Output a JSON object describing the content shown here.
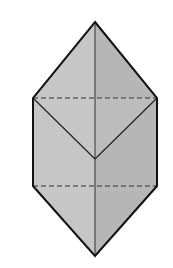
{
  "diagram": {
    "type": "3D solid line drawing",
    "vertices": {
      "top_apex": [
        95,
        22
      ],
      "upper_left": [
        33,
        98
      ],
      "upper_right": [
        157,
        98
      ],
      "center_v": [
        95,
        159
      ],
      "lower_left": [
        33,
        186
      ],
      "lower_right": [
        157,
        186
      ],
      "bottom_apex": [
        95,
        256
      ]
    },
    "colors": {
      "background": "#ffffff",
      "left_face": "#c6c6c6",
      "right_face": "#b6b6b6",
      "outline": "#111111",
      "inner_edge": "#333333",
      "hidden_edge": "#333333"
    },
    "labels": []
  }
}
